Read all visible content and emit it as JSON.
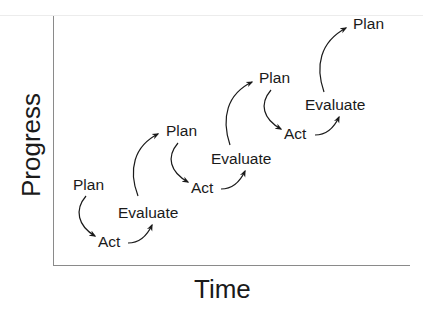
{
  "axes": {
    "x_label": "Time",
    "y_label": "Progress"
  },
  "cycles": [
    {
      "plan": "Plan",
      "act": "Act",
      "evaluate": "Evaluate"
    },
    {
      "plan": "Plan",
      "act": "Act",
      "evaluate": "Evaluate"
    },
    {
      "plan": "Plan",
      "act": "Act",
      "evaluate": "Evaluate"
    }
  ],
  "final": {
    "plan": "Plan"
  },
  "colors": {
    "ink": "#1a1a1a",
    "axis": "#8a8a8a"
  }
}
